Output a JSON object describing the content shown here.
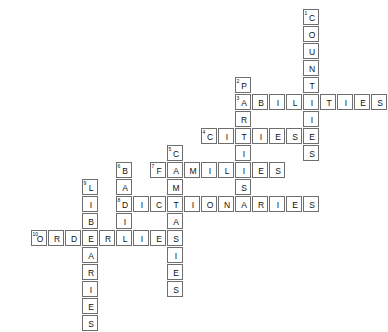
{
  "puzzle": {
    "kind": "crossword-grid",
    "cell_size_px": 17,
    "origin": {
      "x": 14,
      "y": 9
    },
    "colors": {
      "cell_border": "#6e6e6e",
      "cell_fill": "#ffffff",
      "text": "#111111",
      "background": "#ffffff"
    },
    "entries": [
      {
        "number": "1",
        "answer": "COUNTRIES",
        "direction": "down",
        "row": 0,
        "col": 17,
        "length": 9
      },
      {
        "number": "2",
        "answer": "PARTIES",
        "direction": "down",
        "row": 4,
        "col": 13,
        "length": 7
      },
      {
        "number": "3",
        "answer": "ABILITIES",
        "direction": "across",
        "row": 5,
        "col": 13,
        "length": 9
      },
      {
        "number": "4",
        "answer": "CITIES",
        "direction": "across",
        "row": 7,
        "col": 11,
        "length": 6
      },
      {
        "number": "5",
        "answer": "COMPANIES",
        "direction": "down",
        "row": 8,
        "col": 9,
        "length": 9
      },
      {
        "number": "6",
        "answer": "BASIE",
        "direction": "down",
        "row": 9,
        "col": 6,
        "length": 5
      },
      {
        "number": "7",
        "answer": "FAMILIES",
        "direction": "across",
        "row": 9,
        "col": 8,
        "length": 8
      },
      {
        "number": "8",
        "answer": "DICTIONARIES",
        "direction": "across",
        "row": 11,
        "col": 6,
        "length": 12
      },
      {
        "number": "9",
        "answer": "LIBRARIES",
        "direction": "down",
        "row": 10,
        "col": 4,
        "length": 9
      },
      {
        "number": "10",
        "answer": "ORDERLIES",
        "direction": "across",
        "row": 13,
        "col": 1,
        "length": 9
      }
    ]
  }
}
